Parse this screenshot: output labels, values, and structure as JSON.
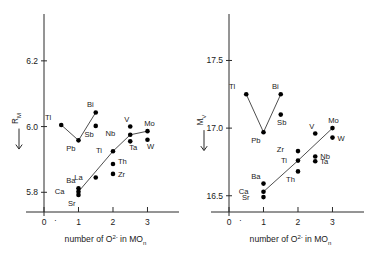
{
  "figure": {
    "background": "#ffffff",
    "point_color": "#000000",
    "axis_color": "#2b2b2b",
    "line_color": "#3a3a3a"
  },
  "axis_text": {
    "x_title_main": "number of O",
    "x_title_sup": "2-",
    "x_title_mid": " in MO",
    "x_title_sub": "n",
    "left_y_main": "R",
    "left_y_sub": "M",
    "right_y_main": "M",
    "right_y_sub": "V"
  },
  "chart_data": [
    {
      "type": "scatter",
      "title": "",
      "xlabel": "number of O2- in MOn",
      "ylabel": "R_M",
      "xlim": [
        0,
        3.45
      ],
      "ylim": [
        5.74,
        6.3
      ],
      "xticks": [
        0,
        1,
        2,
        3
      ],
      "xticklabels": [
        "0",
        "1",
        "2",
        "3"
      ],
      "yticks": [
        5.8,
        6.0,
        6.2
      ],
      "yticklabels": [
        "5.8",
        "6.0",
        "6.2"
      ],
      "grid": false,
      "legend": "none",
      "points": [
        {
          "label": "Tl",
          "x": 0.5,
          "y": 6.005,
          "lx": -10,
          "ly": -5
        },
        {
          "label": "Pb",
          "x": 1.0,
          "y": 5.958,
          "lx": -3,
          "ly": 11
        },
        {
          "label": "Sb",
          "x": 1.5,
          "y": 6.002,
          "lx": -2,
          "ly": 11
        },
        {
          "label": "Bi",
          "x": 1.5,
          "y": 6.043,
          "lx": -2,
          "ly": -5
        },
        {
          "label": "Ba",
          "x": 1.0,
          "y": 5.812,
          "lx": -3,
          "ly": -5
        },
        {
          "label": "Ca",
          "x": 1.0,
          "y": 5.802,
          "lx": -14,
          "ly": 2
        },
        {
          "label": "Sr",
          "x": 1.0,
          "y": 5.792,
          "lx": -3,
          "ly": 11
        },
        {
          "label": "La",
          "x": 1.5,
          "y": 5.845,
          "lx": -13,
          "ly": 2
        },
        {
          "label": "Ti",
          "x": 2.0,
          "y": 5.925,
          "lx": -11,
          "ly": 2
        },
        {
          "label": "Th",
          "x": 2.0,
          "y": 5.886,
          "lx": 5,
          "ly": 0
        },
        {
          "label": "Zr",
          "x": 2.0,
          "y": 5.856,
          "lx": 5,
          "ly": 3
        },
        {
          "label": "V",
          "x": 2.5,
          "y": 6.0,
          "lx": -1,
          "ly": -5
        },
        {
          "label": "Nb",
          "x": 2.5,
          "y": 5.975,
          "lx": -15,
          "ly": 1
        },
        {
          "label": "Ta",
          "x": 2.5,
          "y": 5.955,
          "lx": 3,
          "ly": 9
        },
        {
          "label": "Mo",
          "x": 3.0,
          "y": 5.986,
          "lx": 2,
          "ly": -5
        },
        {
          "label": "W",
          "x": 3.0,
          "y": 5.96,
          "lx": 3,
          "ly": 9
        }
      ],
      "lines": [
        {
          "name": "tl-pb-bi",
          "points": [
            [
              0.5,
              6.005
            ],
            [
              1.0,
              5.958
            ],
            [
              1.5,
              6.043
            ]
          ]
        },
        {
          "name": "main-trend",
          "points": [
            [
              1.0,
              5.802
            ],
            [
              2.0,
              5.925
            ],
            [
              2.5,
              5.975
            ],
            [
              3.0,
              5.986
            ]
          ]
        }
      ]
    },
    {
      "type": "scatter",
      "title": "",
      "xlabel": "number of O2- in MOn",
      "ylabel": "M_V",
      "xlim": [
        0,
        3.45
      ],
      "ylim": [
        16.38,
        17.74
      ],
      "xticks": [
        0,
        1,
        2,
        3
      ],
      "xticklabels": [
        "0",
        "1",
        "2",
        "3"
      ],
      "yticks": [
        16.5,
        17.0,
        17.5
      ],
      "yticklabels": [
        "16.5",
        "17.0",
        "17.5"
      ],
      "grid": false,
      "legend": "none",
      "points": [
        {
          "label": "Tl",
          "x": 0.5,
          "y": 17.25,
          "lx": -11,
          "ly": -5
        },
        {
          "label": "Pb",
          "x": 1.0,
          "y": 16.97,
          "lx": -3,
          "ly": 11
        },
        {
          "label": "Bi",
          "x": 1.5,
          "y": 17.25,
          "lx": -2,
          "ly": -5
        },
        {
          "label": "Sb",
          "x": 1.5,
          "y": 17.1,
          "lx": 1,
          "ly": 10
        },
        {
          "label": "Ba",
          "x": 1.0,
          "y": 16.59,
          "lx": -3,
          "ly": -5
        },
        {
          "label": "Ca",
          "x": 1.0,
          "y": 16.53,
          "lx": -15,
          "ly": 2
        },
        {
          "label": "Sr",
          "x": 1.0,
          "y": 16.49,
          "lx": -14,
          "ly": 3
        },
        {
          "label": "Zr",
          "x": 2.0,
          "y": 16.83,
          "lx": -14,
          "ly": 1
        },
        {
          "label": "Ti",
          "x": 2.0,
          "y": 16.76,
          "lx": -11,
          "ly": 2
        },
        {
          "label": "Th",
          "x": 2.0,
          "y": 16.68,
          "lx": -3,
          "ly": 11
        },
        {
          "label": "V",
          "x": 2.5,
          "y": 16.96,
          "lx": -1,
          "ly": -5
        },
        {
          "label": "Nb",
          "x": 2.5,
          "y": 16.79,
          "lx": 5,
          "ly": 2
        },
        {
          "label": "Ta",
          "x": 2.5,
          "y": 16.755,
          "lx": 5,
          "ly": 3
        },
        {
          "label": "Mo",
          "x": 3.0,
          "y": 17.0,
          "lx": 1,
          "ly": -5
        },
        {
          "label": "W",
          "x": 3.0,
          "y": 16.93,
          "lx": 5,
          "ly": 3
        }
      ],
      "lines": [
        {
          "name": "tl-pb-bi",
          "points": [
            [
              0.5,
              17.25
            ],
            [
              1.0,
              16.97
            ],
            [
              1.5,
              17.25
            ]
          ]
        },
        {
          "name": "main-trend",
          "points": [
            [
              1.0,
              16.53
            ],
            [
              2.0,
              16.76
            ],
            [
              3.0,
              17.0
            ]
          ]
        }
      ]
    }
  ]
}
